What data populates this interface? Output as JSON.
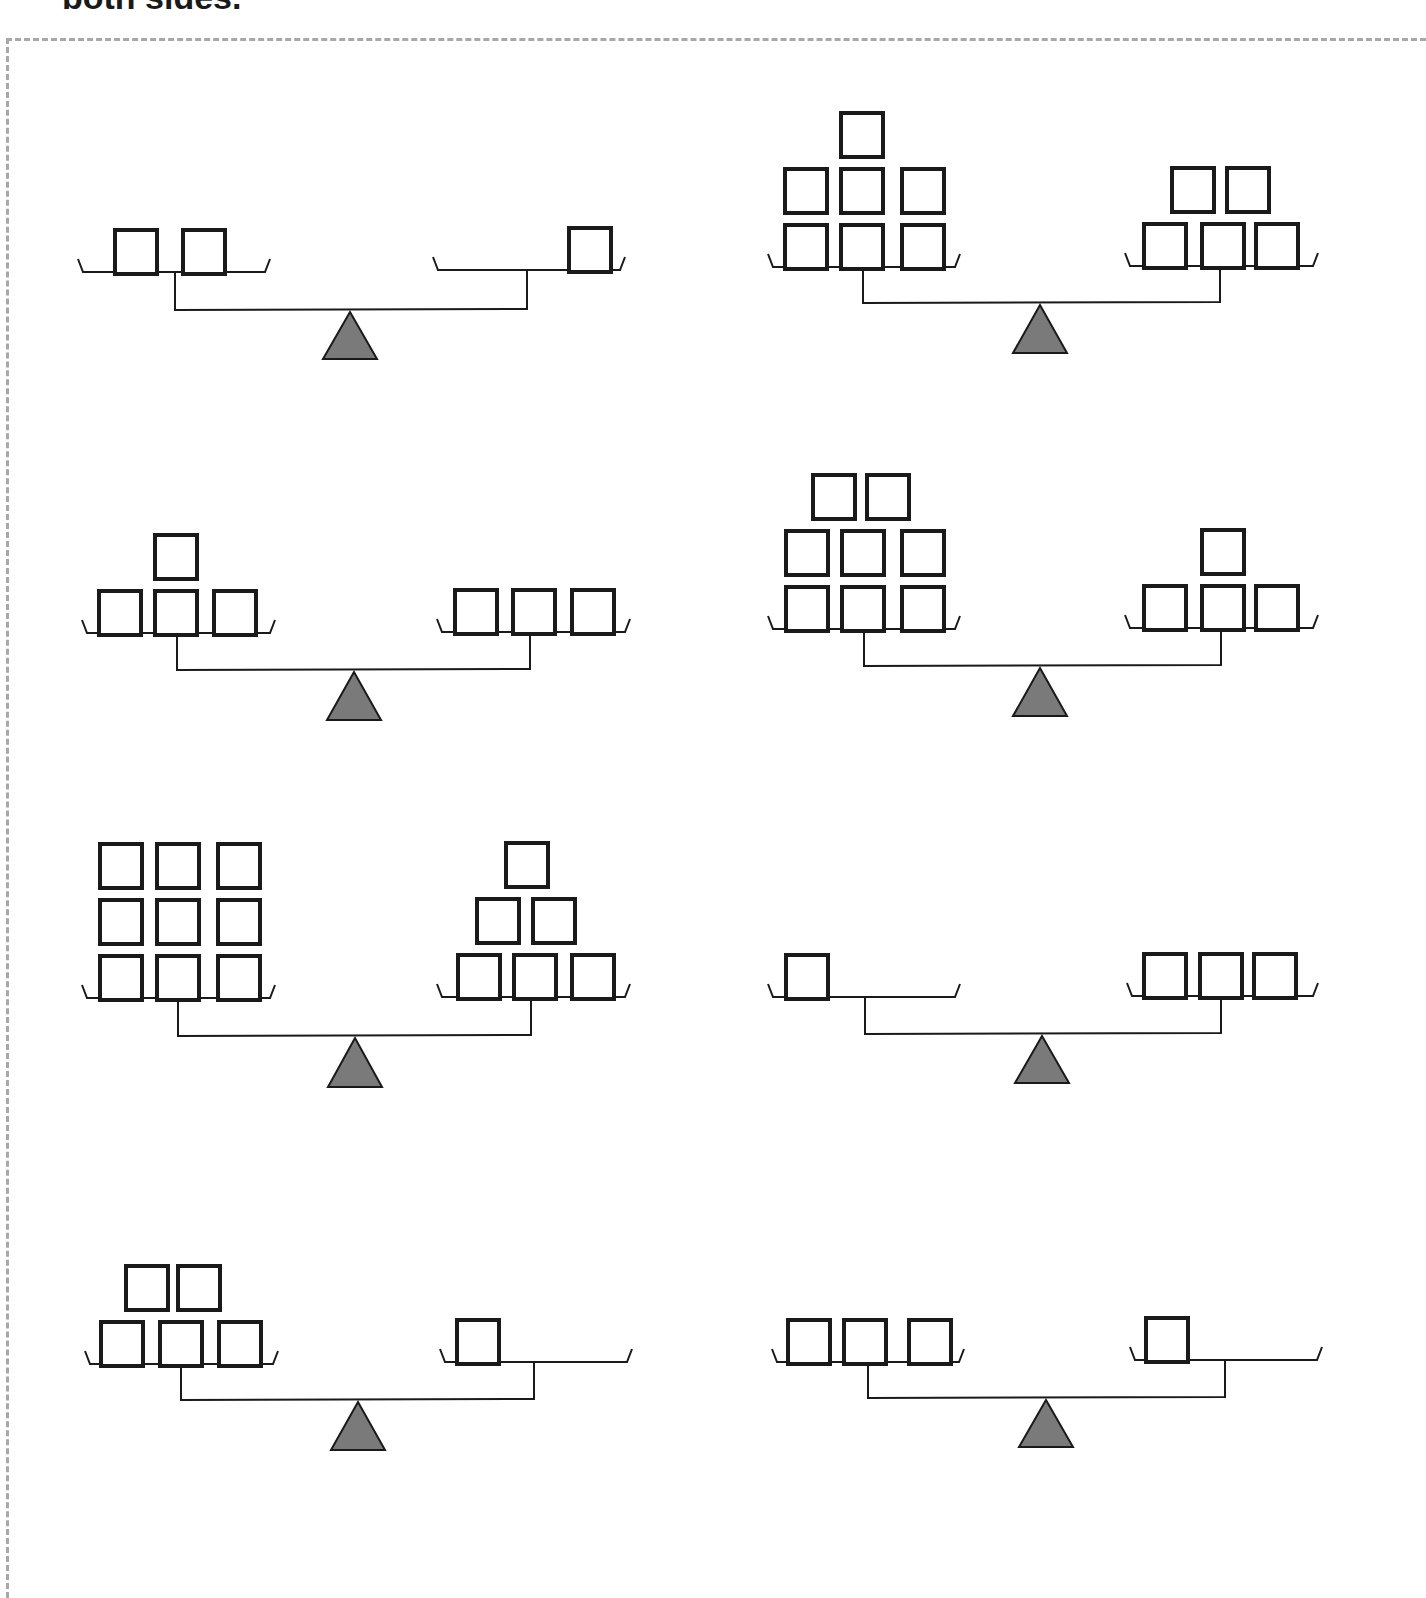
{
  "instruction": {
    "text": "both sides."
  },
  "worksheet": {
    "border_style": "dashed",
    "border_color": "#a8a8a8",
    "block_color": "#1a1a1a",
    "fulcrum_color": "#7a7a7a",
    "scales": [
      {
        "id": 1,
        "left": {
          "count": 2,
          "rows": [
            2
          ]
        },
        "right": {
          "count": 1,
          "rows": [
            1
          ],
          "align": "right"
        },
        "geom": {
          "lx1": 78,
          "lx2": 270,
          "ly": 272,
          "rx1": 433,
          "rx2": 625,
          "ry": 270,
          "lpost": 175,
          "rpost": 527,
          "beam": 310,
          "apex": 350,
          "base": 359
        },
        "left_blocks_x": [
          [
            113,
            181
          ]
        ],
        "right_blocks_x": [
          [
            567
          ]
        ]
      },
      {
        "id": 2,
        "left": {
          "count": 7,
          "rows": [
            3,
            3,
            1
          ]
        },
        "right": {
          "count": 5,
          "rows": [
            3,
            2
          ]
        },
        "geom": {
          "lx1": 768,
          "lx2": 960,
          "ly": 267,
          "rx1": 1125,
          "rx2": 1318,
          "ry": 266,
          "lpost": 863,
          "rpost": 1220,
          "beam": 303,
          "apex": 1040,
          "base": 353
        },
        "left_blocks_x": [
          [
            783,
            839,
            900
          ],
          [
            783,
            839,
            900
          ],
          [
            839
          ]
        ],
        "right_blocks_x": [
          [
            1142,
            1200,
            1254
          ],
          [
            1170,
            1225
          ]
        ]
      },
      {
        "id": 3,
        "left": {
          "count": 4,
          "rows": [
            3,
            1
          ]
        },
        "right": {
          "count": 3,
          "rows": [
            3
          ]
        },
        "geom": {
          "lx1": 82,
          "lx2": 275,
          "ly": 633,
          "rx1": 437,
          "rx2": 630,
          "ry": 632,
          "lpost": 177,
          "rpost": 530,
          "beam": 670,
          "apex": 354,
          "base": 720
        },
        "left_blocks_x": [
          [
            97,
            153,
            212
          ],
          [
            153
          ]
        ],
        "right_blocks_x": [
          [
            453,
            511,
            570
          ]
        ]
      },
      {
        "id": 4,
        "left": {
          "count": 8,
          "rows": [
            3,
            3,
            2
          ]
        },
        "right": {
          "count": 4,
          "rows": [
            3,
            1
          ]
        },
        "geom": {
          "lx1": 768,
          "lx2": 960,
          "ly": 629,
          "rx1": 1125,
          "rx2": 1318,
          "ry": 628,
          "lpost": 864,
          "rpost": 1221,
          "beam": 666,
          "apex": 1040,
          "base": 716
        },
        "left_blocks_x": [
          [
            784,
            840,
            900
          ],
          [
            784,
            840,
            900
          ],
          [
            811,
            865
          ]
        ],
        "right_blocks_x": [
          [
            1142,
            1200,
            1254
          ],
          [
            1200
          ]
        ]
      },
      {
        "id": 5,
        "left": {
          "count": 9,
          "rows": [
            3,
            3,
            3
          ]
        },
        "right": {
          "count": 6,
          "rows": [
            3,
            2,
            1
          ]
        },
        "geom": {
          "lx1": 82,
          "lx2": 275,
          "ly": 998,
          "rx1": 437,
          "rx2": 630,
          "ry": 997,
          "lpost": 178,
          "rpost": 531,
          "beam": 1036,
          "apex": 355,
          "base": 1087
        },
        "left_blocks_x": [
          [
            98,
            155,
            216
          ],
          [
            98,
            155,
            216
          ],
          [
            98,
            155,
            216
          ]
        ],
        "right_blocks_x": [
          [
            456,
            512,
            570
          ],
          [
            475,
            531
          ],
          [
            504
          ]
        ]
      },
      {
        "id": 6,
        "left": {
          "count": 1,
          "rows": [
            1
          ],
          "align": "left"
        },
        "right": {
          "count": 3,
          "rows": [
            3
          ]
        },
        "geom": {
          "lx1": 768,
          "lx2": 960,
          "ly": 997,
          "rx1": 1127,
          "rx2": 1318,
          "ry": 996,
          "lpost": 865,
          "rpost": 1221,
          "beam": 1034,
          "apex": 1042,
          "base": 1083
        },
        "left_blocks_x": [
          [
            784
          ]
        ],
        "right_blocks_x": [
          [
            1142,
            1198,
            1252
          ]
        ]
      },
      {
        "id": 7,
        "left": {
          "count": 5,
          "rows": [
            3,
            2
          ]
        },
        "right": {
          "count": 1,
          "rows": [
            1
          ],
          "align": "left"
        },
        "geom": {
          "lx1": 85,
          "lx2": 278,
          "ly": 1364,
          "rx1": 440,
          "rx2": 632,
          "ry": 1362,
          "lpost": 181,
          "rpost": 534,
          "beam": 1400,
          "apex": 358,
          "base": 1450
        },
        "left_blocks_x": [
          [
            99,
            158,
            217
          ],
          [
            124,
            176
          ]
        ],
        "right_blocks_x": [
          [
            455
          ]
        ]
      },
      {
        "id": 8,
        "left": {
          "count": 3,
          "rows": [
            3
          ]
        },
        "right": {
          "count": 1,
          "rows": [
            1
          ],
          "align": "left"
        },
        "geom": {
          "lx1": 772,
          "lx2": 964,
          "ly": 1362,
          "rx1": 1130,
          "rx2": 1322,
          "ry": 1360,
          "lpost": 868,
          "rpost": 1225,
          "beam": 1398,
          "apex": 1046,
          "base": 1447
        },
        "left_blocks_x": [
          [
            786,
            842,
            907
          ]
        ],
        "right_blocks_x": [
          [
            1144
          ]
        ]
      }
    ]
  }
}
